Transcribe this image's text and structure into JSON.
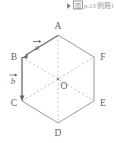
{
  "header": {
    "marker_icon": "play-triangle-icon",
    "boxed_label": "図",
    "reference_text": "p.13 例題1"
  },
  "figure": {
    "vertices": [
      {
        "id": "A",
        "label": "A",
        "x": 58,
        "y": 24,
        "label_x": 58,
        "label_y": 18
      },
      {
        "id": "B",
        "label": "B",
        "x": 22,
        "y": 46,
        "label_x": 13,
        "label_y": 48
      },
      {
        "id": "C",
        "label": "C",
        "x": 22,
        "y": 90,
        "label_x": 13,
        "label_y": 96
      },
      {
        "id": "D",
        "label": "D",
        "x": 58,
        "y": 112,
        "label_x": 58,
        "label_y": 124
      },
      {
        "id": "E",
        "label": "E",
        "x": 94,
        "y": 90,
        "label_x": 103,
        "label_y": 96
      },
      {
        "id": "F",
        "label": "F",
        "x": 94,
        "y": 46,
        "label_x": 103,
        "label_y": 48
      }
    ],
    "center": {
      "id": "O",
      "label": "O",
      "x": 58,
      "y": 68,
      "label_x": 63,
      "label_y": 77
    },
    "edges": [
      {
        "from": "A",
        "to": "B",
        "style": "solid"
      },
      {
        "from": "B",
        "to": "C",
        "style": "solid"
      },
      {
        "from": "C",
        "to": "D",
        "style": "solid"
      },
      {
        "from": "D",
        "to": "E",
        "style": "solid"
      },
      {
        "from": "E",
        "to": "F",
        "style": "solid"
      },
      {
        "from": "F",
        "to": "A",
        "style": "solid"
      }
    ],
    "diagonals": [
      {
        "from": "A",
        "to": "D",
        "style": "dashed"
      },
      {
        "from": "B",
        "to": "E",
        "style": "dashed"
      },
      {
        "from": "C",
        "to": "F",
        "style": "dashed"
      }
    ],
    "vectors": [
      {
        "name": "a",
        "label": "a",
        "from": "A",
        "to": "B",
        "label_x": 36,
        "label_y": 36
      },
      {
        "name": "b",
        "label": "b",
        "from": "B",
        "to": "C",
        "label_x": 12,
        "label_y": 71
      }
    ]
  }
}
